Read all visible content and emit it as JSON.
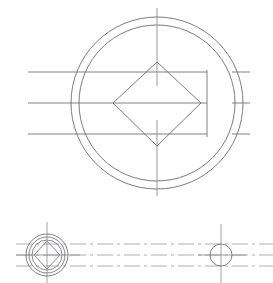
{
  "document": {
    "type": "engineering-drawing",
    "title": "",
    "background_color": "#ffffff",
    "width": 273,
    "height": 283,
    "line_color": "#6b6b73",
    "centerline_color": "#8a8a92",
    "phantom_color": "#9a9aa2"
  },
  "views": {
    "top_view": {
      "name": "front-view",
      "center": {
        "x": 157,
        "y": 103
      },
      "outer_circle": {
        "cx": 157,
        "cy": 103,
        "r": 86
      },
      "inner_circle": {
        "cx": 157,
        "cy": 103,
        "r": 78
      },
      "diamond": {
        "points": "157,62 201,103 157,146 113,103",
        "top": {
          "x": 157,
          "y": 62
        },
        "right": {
          "x": 201,
          "y": 103
        },
        "bottom": {
          "x": 157,
          "y": 146
        },
        "left": {
          "x": 113,
          "y": 103
        }
      },
      "vertical_centerline": {
        "x": 157,
        "y1": 8,
        "y2": 196,
        "gap_y1": 86,
        "gap_y2": 120
      },
      "inner_vertical_edge": {
        "x": 207,
        "y1": 70,
        "y2": 137
      },
      "horizontal_lines": [
        {
          "y": 72,
          "x1": 28,
          "x2": 207
        },
        {
          "y": 103,
          "x1": 28,
          "x2": 207
        },
        {
          "y": 134,
          "x1": 28,
          "x2": 207
        }
      ],
      "right_dashes": [
        {
          "y": 72,
          "x1": 232,
          "x2": 250
        },
        {
          "y": 103,
          "x1": 232,
          "x2": 250
        },
        {
          "y": 134,
          "x1": 232,
          "x2": 250
        }
      ]
    },
    "bottom_view": {
      "name": "section-view",
      "left_detail": {
        "center": {
          "x": 47,
          "y": 255
        },
        "outer_circle_r": 21,
        "mid_circle_r": 18,
        "inner_circle_r": 15,
        "diamond_points": "47,241 60,255 47,269 34,255",
        "vertical_centerline": {
          "x": 47,
          "y1": 222,
          "y2": 283
        },
        "horizontal_centerline": {
          "y": 255,
          "x1": 16,
          "x2": 80
        }
      },
      "right_detail": {
        "center": {
          "x": 221,
          "y": 255
        },
        "circle_r": 11,
        "vertical_centerline": {
          "x": 221,
          "y1": 224,
          "y2": 283
        },
        "horizontal_centerline": {
          "y": 255,
          "x1": 198,
          "x2": 246
        }
      },
      "connector_lines": [
        {
          "y": 244,
          "x1": 16,
          "x2": 273
        },
        {
          "y": 255,
          "x1": 16,
          "x2": 273
        },
        {
          "y": 266,
          "x1": 16,
          "x2": 273
        }
      ]
    }
  },
  "labels": {
    "top_view_label": "",
    "section_view_label": ""
  }
}
